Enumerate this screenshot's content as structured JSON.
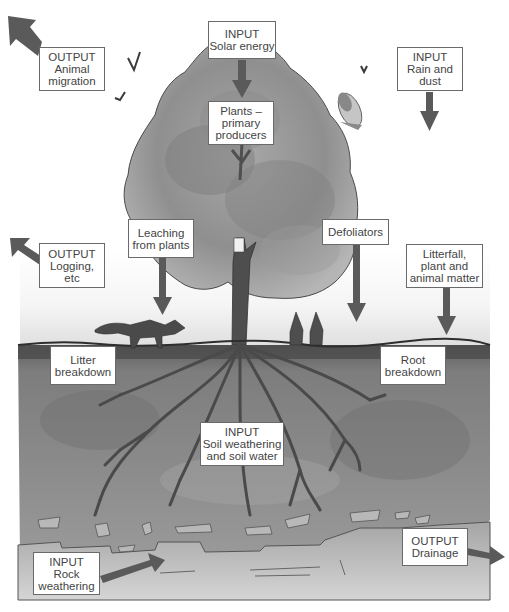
{
  "diagram": {
    "colors": {
      "arrow": "#5a5a5a",
      "box_border": "#6a6a6a",
      "text": "#444444",
      "canopy": "#9a9a9a",
      "soil": "#7a7a7a",
      "ground_line": "#3a3a3a"
    },
    "labels": {
      "animal_migration": {
        "line1": "OUTPUT",
        "line2": "Animal",
        "line3": "migration"
      },
      "solar_energy": {
        "line1": "INPUT",
        "line2": "Solar energy"
      },
      "rain_and_dust": {
        "line1": "INPUT",
        "line2": "Rain and",
        "line3": "dust"
      },
      "plants_primary_producers": {
        "line1": "Plants –",
        "line2": "primary",
        "line3": "producers"
      },
      "logging": {
        "line1": "OUTPUT",
        "line2": "Logging,",
        "line3": "etc"
      },
      "leaching_from_plants": {
        "line1": "Leaching",
        "line2": "from plants"
      },
      "defoliators": {
        "line1": "Defoliators"
      },
      "litterfall": {
        "line1": "Litterfall,",
        "line2": "plant and",
        "line3": "animal matter"
      },
      "litter_breakdown": {
        "line1": "Litter",
        "line2": "breakdown"
      },
      "root_breakdown": {
        "line1": "Root",
        "line2": "breakdown"
      },
      "soil_weathering": {
        "line1": "INPUT",
        "line2": "Soil weathering",
        "line3": "and soil water"
      },
      "rock_weathering": {
        "line1": "INPUT",
        "line2": "Rock",
        "line3": "weathering"
      },
      "drainage": {
        "line1": "OUTPUT",
        "line2": "Drainage"
      }
    },
    "illustration": {
      "elements": [
        "deciduous-tree",
        "owl",
        "fox",
        "two-rabbits",
        "birds",
        "roots",
        "soil-layer",
        "bedrock"
      ]
    }
  }
}
